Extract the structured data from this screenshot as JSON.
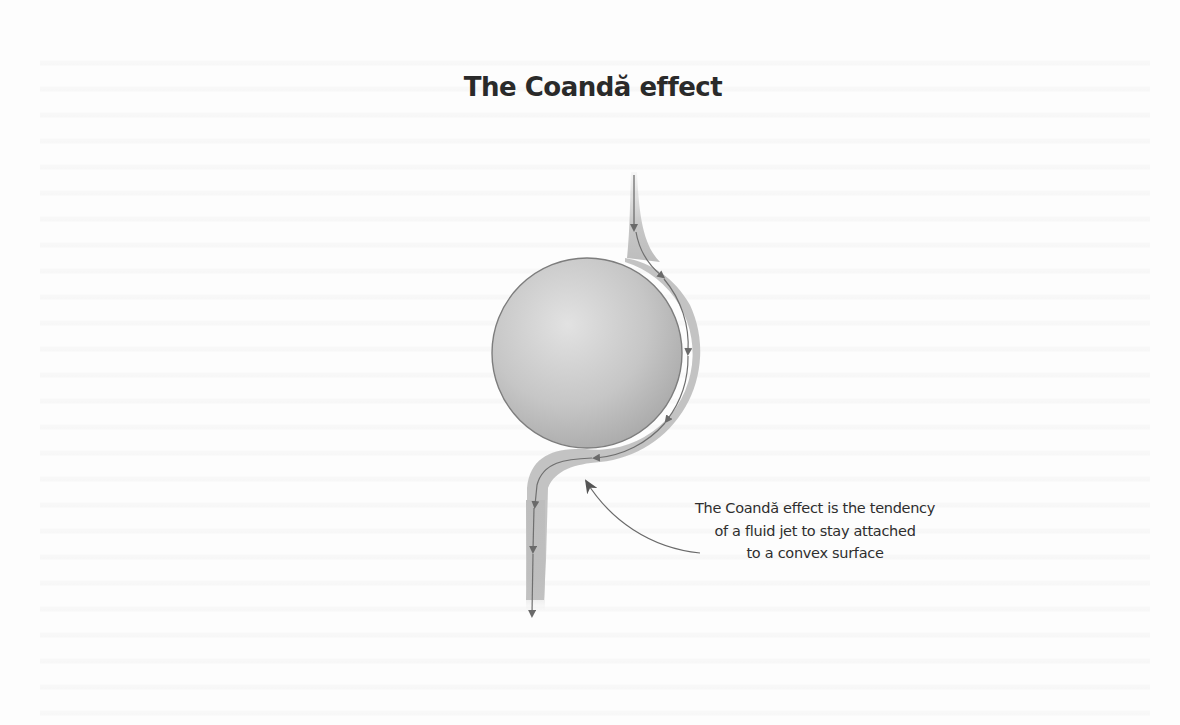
{
  "figure": {
    "title": "The Coandă effect",
    "caption": {
      "lines": [
        "The Coandă effect is the tendency",
        "of a fluid jet to stay attached",
        "to a convex surface"
      ]
    },
    "elements": {
      "surface": "convex-cylinder",
      "jet_in": "downward-jet-above-cylinder",
      "jet_out": "downward-jet-below-cylinder",
      "annotation": "curved-arrow-pointing-to-attached-flow"
    },
    "colors": {
      "background": "#fdfdfd",
      "cylinder_light": "#d9d9d9",
      "cylinder_dark": "#9a9a9a",
      "flow_band": "#bdbdbd",
      "flow_line": "#6f6f6f",
      "text": "#2a2a2a"
    }
  }
}
